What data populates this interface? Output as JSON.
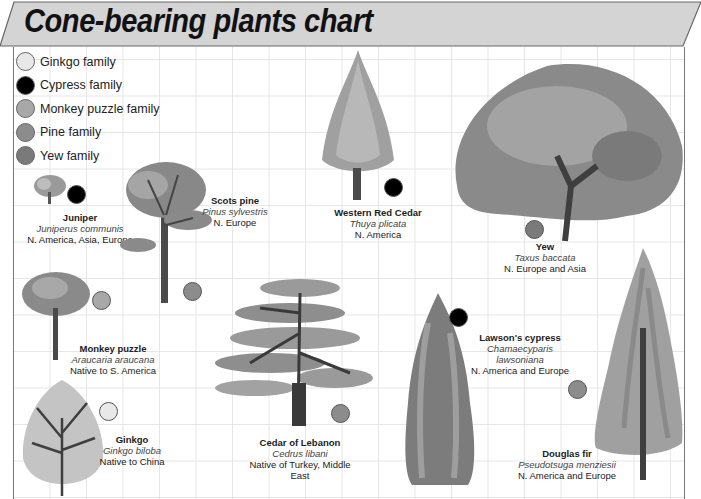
{
  "title": "Cone-bearing plants chart",
  "colors": {
    "ginkgo": "#e8e8e8",
    "cypress": "#000000",
    "monkey_puzzle": "#a8a8a8",
    "pine": "#8c8c8c",
    "yew": "#7a7a7a",
    "banner": "#d4d4d4",
    "grid": "#e6e6e6"
  },
  "legend": [
    {
      "label": "Ginkgo family",
      "color_key": "ginkgo"
    },
    {
      "label": "Cypress family",
      "color_key": "cypress"
    },
    {
      "label": "Monkey puzzle family",
      "color_key": "monkey_puzzle"
    },
    {
      "label": "Pine family",
      "color_key": "pine"
    },
    {
      "label": "Yew family",
      "color_key": "yew"
    }
  ],
  "plants": [
    {
      "name": "Juniper",
      "scientific": "Juniperus communis",
      "range": "N. America, Asia, Europe",
      "family": "cypress"
    },
    {
      "name": "Scots pine",
      "scientific": "Pinus sylvestris",
      "range": "N. Europe",
      "family": "pine"
    },
    {
      "name": "Western Red Cedar",
      "scientific": "Thuya plicata",
      "range": "N. America",
      "family": "cypress"
    },
    {
      "name": "Yew",
      "scientific": "Taxus baccata",
      "range": "N. Europe and Asia",
      "family": "yew"
    },
    {
      "name": "Monkey puzzle",
      "scientific": "Araucaria araucana",
      "range": "Native to S. America",
      "family": "monkey_puzzle"
    },
    {
      "name": "Lawson's cypress",
      "scientific": "Chamaecyparis lawsoniana",
      "scientific_line1": "Chamaecyparis",
      "scientific_line2": "lawsoniana",
      "range": "N. America and Europe",
      "family": "cypress"
    },
    {
      "name": "Ginkgo",
      "scientific": "Ginkgo biloba",
      "range": "Native to China",
      "family": "ginkgo"
    },
    {
      "name": "Cedar of Lebanon",
      "scientific": "Cedrus libani",
      "range": "Native of Turkey, Middle East",
      "range_line1": "Native of Turkey, Middle",
      "range_line2": "East",
      "family": "pine"
    },
    {
      "name": "Douglas fir",
      "scientific": "Pseudotsuga menziesii",
      "range": "N. America and Europe",
      "family": "pine"
    }
  ]
}
